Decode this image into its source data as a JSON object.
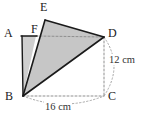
{
  "figure": {
    "background_color": "#ffffff",
    "stroke_color": "#1a1a1a",
    "dotted_color": "#9a9a9a",
    "fill_light": "#cfcfcf",
    "fill_dark": "#c2c2c2"
  },
  "vertices": [
    {
      "id": "A",
      "label": "A",
      "x": 22,
      "y": 36,
      "label_x": 4,
      "label_y": 28
    },
    {
      "id": "B",
      "label": "B",
      "x": 23,
      "y": 96,
      "label_x": 6,
      "label_y": 91
    },
    {
      "id": "C",
      "label": "C",
      "x": 104,
      "y": 96,
      "label_x": 108,
      "label_y": 91
    },
    {
      "id": "D",
      "label": "D",
      "x": 104,
      "y": 37,
      "label_x": 108,
      "label_y": 28
    },
    {
      "id": "E",
      "label": "E",
      "x": 45,
      "y": 20,
      "label_x": 40,
      "label_y": 2
    },
    {
      "id": "F",
      "label": "F",
      "x": 36,
      "y": 36,
      "label_x": 31,
      "label_y": 24
    }
  ],
  "dimensions": [
    {
      "id": "vertical",
      "label": "12 cm",
      "label_x": 111,
      "label_y": 60
    },
    {
      "id": "horizontal",
      "label": "16 cm",
      "label_x": 50,
      "label_y": 106
    }
  ],
  "shapes": {
    "triangle_bed": "B,E,D shaded triangle",
    "strip_abf": "A,F,B shaded strip",
    "solid_edges": [
      "A-F",
      "A-B",
      "B-E",
      "E-D",
      "B-D"
    ],
    "dotted_edges": [
      "F-D",
      "B-C",
      "C-D"
    ],
    "arcs": [
      "D-C outward arc",
      "B-C outward arc"
    ]
  }
}
